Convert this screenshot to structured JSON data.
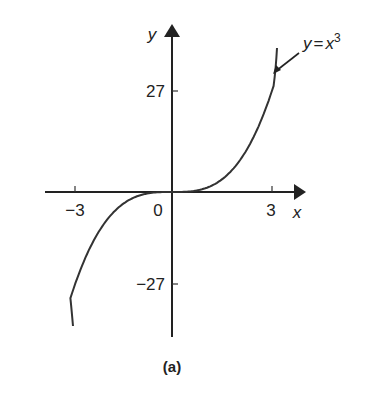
{
  "chart_data": {
    "type": "line",
    "title": "",
    "caption": "(a)",
    "xlabel": "x",
    "ylabel": "y",
    "xlim": [
      -3.8,
      4
    ],
    "ylim": [
      -38,
      45
    ],
    "grid": false,
    "x_ticks": [
      -3,
      0,
      3
    ],
    "x_tick_labels": [
      "−3",
      "0",
      "3"
    ],
    "y_ticks": [
      27,
      -27
    ],
    "y_tick_labels": [
      "27",
      "−27"
    ],
    "series": [
      {
        "name": "y = x^3",
        "label_text": "y = x",
        "label_exponent": "3",
        "function": "x^3",
        "x": [
          -3,
          -2,
          -1,
          0,
          1,
          2,
          3
        ],
        "values": [
          -27,
          -8,
          -1,
          0,
          1,
          8,
          27
        ]
      }
    ],
    "annotations": [
      {
        "text": "y = x^3",
        "points_to": "curve upper end"
      }
    ]
  }
}
